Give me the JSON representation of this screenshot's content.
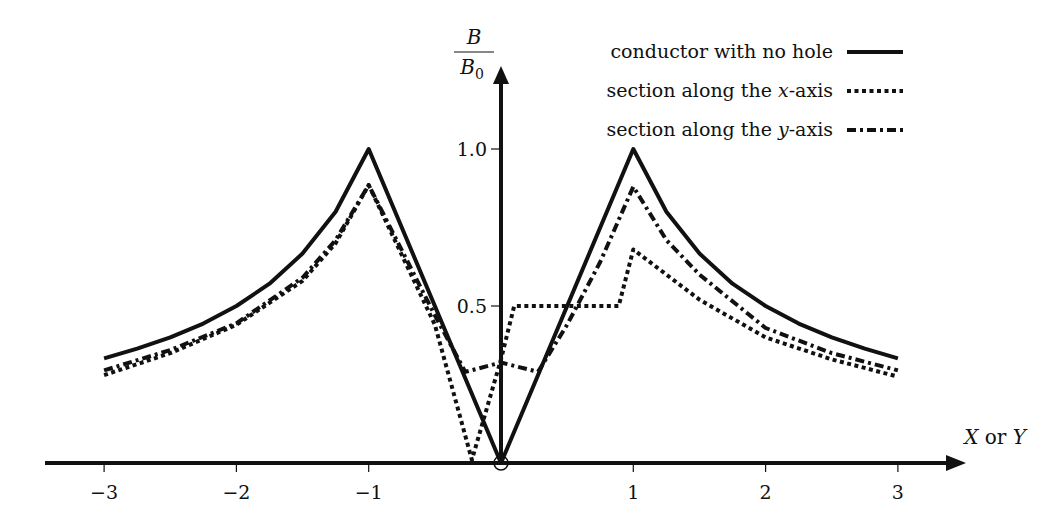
{
  "chart_data": {
    "type": "line",
    "title": "",
    "xlabel": "X or Y",
    "xlabel_parts": [
      {
        "text": "X",
        "italic": true
      },
      {
        "text": " or ",
        "italic": false
      },
      {
        "text": "Y",
        "italic": true
      }
    ],
    "ylabel": "B/B0",
    "ylabel_num": "B",
    "ylabel_den": "B",
    "ylabel_den_sub": "0",
    "xlim": [
      -3,
      3
    ],
    "ylim": [
      0,
      1.1
    ],
    "x_ticks": [
      -3,
      -2,
      -1,
      1,
      2,
      3
    ],
    "x_tick_labels": [
      "−3",
      "−2",
      "−1",
      "1",
      "2",
      "3"
    ],
    "y_ticks": [
      0.5,
      1.0
    ],
    "y_tick_labels": [
      "0.5",
      "1.0"
    ],
    "grid": false,
    "legend_position": "top-right",
    "origin_marker": "circle",
    "series": [
      {
        "name": "conductor with no hole",
        "legend_parts": [
          {
            "text": "conductor with no hole",
            "italic": false
          }
        ],
        "style": "solid",
        "points": [
          [
            -3,
            0.333
          ],
          [
            -2.75,
            0.364
          ],
          [
            -2.5,
            0.4
          ],
          [
            -2.25,
            0.444
          ],
          [
            -2,
            0.5
          ],
          [
            -1.75,
            0.571
          ],
          [
            -1.5,
            0.667
          ],
          [
            -1.25,
            0.8
          ],
          [
            -1,
            1.0
          ],
          [
            0,
            0.0
          ],
          [
            1,
            1.0
          ],
          [
            1.25,
            0.8
          ],
          [
            1.5,
            0.667
          ],
          [
            1.75,
            0.571
          ],
          [
            2,
            0.5
          ],
          [
            2.25,
            0.444
          ],
          [
            2.5,
            0.4
          ],
          [
            2.75,
            0.364
          ],
          [
            3,
            0.333
          ]
        ]
      },
      {
        "name": "section along the x-axis",
        "legend_parts": [
          {
            "text": "section along the ",
            "italic": false
          },
          {
            "text": "x",
            "italic": true
          },
          {
            "text": "-axis",
            "italic": false
          }
        ],
        "style": "dotted",
        "points": [
          [
            -3,
            0.28
          ],
          [
            -2.5,
            0.35
          ],
          [
            -2,
            0.44
          ],
          [
            -1.5,
            0.58
          ],
          [
            -1.25,
            0.7
          ],
          [
            -1,
            0.885
          ],
          [
            -0.5,
            0.44
          ],
          [
            -0.22,
            0.01
          ],
          [
            0,
            0.33
          ],
          [
            0.1,
            0.5
          ],
          [
            0.89,
            0.5
          ],
          [
            1,
            0.68
          ],
          [
            1.25,
            0.6
          ],
          [
            1.5,
            0.52
          ],
          [
            2,
            0.4
          ],
          [
            2.5,
            0.33
          ],
          [
            3,
            0.275
          ]
        ]
      },
      {
        "name": "section along the y-axis",
        "legend_parts": [
          {
            "text": "section along the ",
            "italic": false
          },
          {
            "text": "y",
            "italic": true
          },
          {
            "text": "-axis",
            "italic": false
          }
        ],
        "style": "dashdot",
        "points": [
          [
            -3,
            0.295
          ],
          [
            -2.5,
            0.36
          ],
          [
            -2,
            0.445
          ],
          [
            -1.5,
            0.59
          ],
          [
            -1.25,
            0.71
          ],
          [
            -1,
            0.885
          ],
          [
            -0.5,
            0.47
          ],
          [
            -0.27,
            0.29
          ],
          [
            0,
            0.32
          ],
          [
            0.28,
            0.29
          ],
          [
            0.5,
            0.44
          ],
          [
            0.75,
            0.64
          ],
          [
            1,
            0.88
          ],
          [
            1.25,
            0.71
          ],
          [
            1.5,
            0.6
          ],
          [
            2,
            0.43
          ],
          [
            2.5,
            0.35
          ],
          [
            3,
            0.295
          ]
        ]
      }
    ]
  }
}
